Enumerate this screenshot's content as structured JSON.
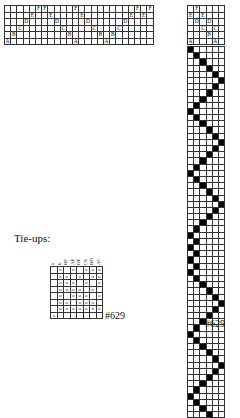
{
  "threading": {
    "rows": 6,
    "cols": 24,
    "row_labels": [
      "F",
      "E",
      "D",
      "C",
      "B",
      "A"
    ],
    "entries": [
      [
        5,
        0
      ],
      [
        4,
        1
      ],
      [
        3,
        2
      ],
      [
        2,
        3
      ],
      [
        1,
        4
      ],
      [
        0,
        5
      ],
      [
        0,
        6
      ],
      [
        1,
        7
      ],
      [
        2,
        8
      ],
      [
        3,
        9
      ],
      [
        4,
        10
      ],
      [
        5,
        11
      ],
      [
        0,
        11
      ],
      [
        1,
        12
      ],
      [
        2,
        13
      ],
      [
        3,
        14
      ],
      [
        4,
        15
      ],
      [
        5,
        16
      ],
      [
        4,
        17
      ],
      [
        3,
        18
      ],
      [
        2,
        19
      ],
      [
        1,
        20
      ],
      [
        0,
        21
      ],
      [
        1,
        22
      ],
      [
        0,
        23
      ]
    ]
  },
  "threading_right": {
    "rows": 6,
    "cols": 6,
    "entries": [
      [
        0,
        1
      ],
      [
        1,
        0
      ],
      [
        1,
        2
      ],
      [
        2,
        1
      ],
      [
        2,
        3
      ],
      [
        3,
        2
      ],
      [
        3,
        4
      ],
      [
        4,
        3
      ],
      [
        5,
        0
      ],
      [
        5,
        4
      ]
    ]
  },
  "treadling": {
    "rows": 60,
    "cols": 6,
    "entries": [
      0,
      1,
      2,
      3,
      4,
      5,
      4,
      3,
      2,
      1,
      0,
      1,
      2,
      3,
      4,
      5,
      4,
      3,
      2,
      1,
      0,
      1,
      2,
      3,
      4,
      5,
      4,
      3,
      2,
      1,
      0,
      1,
      0,
      1,
      0,
      1,
      0,
      1,
      2,
      3,
      4,
      5,
      4,
      3,
      2,
      1,
      0,
      1,
      2,
      3,
      4,
      5,
      4,
      3,
      2,
      1,
      0,
      1,
      2,
      3
    ]
  },
  "tieup": {
    "title": "Tie-ups:",
    "headers": [
      "a",
      "b",
      "BF",
      "AE",
      "DF",
      "CE",
      "BD",
      "AC"
    ],
    "rows": [
      [
        "",
        "o",
        "",
        "o",
        "",
        "o",
        "o",
        "o"
      ],
      [
        "",
        "o",
        "o",
        "",
        "o",
        "",
        "o",
        "o"
      ],
      [
        "",
        "o",
        "o",
        "o",
        "",
        "o",
        "",
        "o"
      ],
      [
        "",
        "o",
        "o",
        "o",
        "o",
        "",
        "o",
        ""
      ],
      [
        "",
        "o",
        "",
        "o",
        "o",
        "o",
        "",
        "o"
      ],
      [
        "",
        "o",
        "o",
        "",
        "o",
        "o",
        "o",
        ""
      ],
      [
        "",
        "o",
        "o",
        "o",
        "o",
        "o",
        "o",
        "o"
      ],
      [
        "o",
        "",
        "",
        "",
        "",
        "",
        "",
        ""
      ]
    ]
  },
  "draft_number_left": "#629",
  "draft_number_right": "#629"
}
